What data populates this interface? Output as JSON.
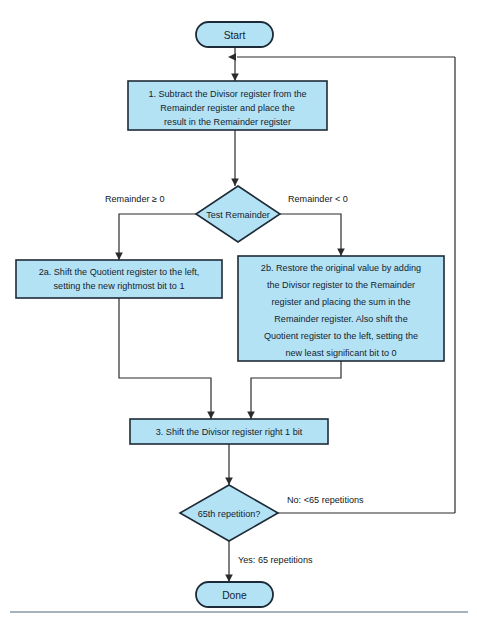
{
  "figure": {
    "colors": {
      "node_fill": "#b3e2f4",
      "node_stroke": "#1d2b38",
      "connector": "#2b2b2b",
      "text": "#16222e",
      "rule": "#8a9aa6",
      "background": "#ffffff"
    }
  },
  "terminators": {
    "start": "Start",
    "done": "Done"
  },
  "steps": {
    "step1": {
      "id": "step-1",
      "lines": [
        "1.  Subtract the Divisor register from the",
        "Remainder register and place the",
        "result in the Remainder register"
      ]
    },
    "step2a": {
      "id": "step-2a",
      "lines": [
        "2a.  Shift the Quotient register to the left,",
        "setting the new rightmost bit to 1"
      ]
    },
    "step2b": {
      "id": "step-2b",
      "lines": [
        "2b.  Restore the original value by adding",
        "the Divisor register to the Remainder",
        "register and placing the sum in the",
        "Remainder register. Also shift the",
        "Quotient register to the left, setting the",
        "new least significant bit to 0"
      ]
    },
    "step3": {
      "id": "step-3",
      "lines": [
        "3.  Shift the Divisor register right 1 bit"
      ]
    }
  },
  "decisions": {
    "test_remainder": {
      "id": "test-remainder",
      "label": "Test Remainder",
      "branch_left": "Remainder ≥ 0",
      "branch_right": "Remainder < 0"
    },
    "repetition_check": {
      "id": "repetition-check",
      "label": "65th repetition?",
      "branch_no": "No: <65 repetitions",
      "branch_yes": "Yes: 65 repetitions"
    }
  }
}
